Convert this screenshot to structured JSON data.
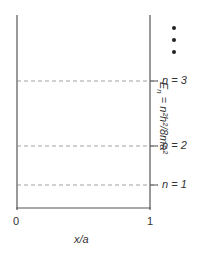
{
  "diagram": {
    "x_axis": {
      "label": "x/a",
      "ticks": [
        "0",
        "1"
      ]
    },
    "levels": [
      {
        "n_label": "n = 3",
        "y": 81
      },
      {
        "n_label": "n = 2",
        "y": 146
      },
      {
        "n_label": "n = 1",
        "y": 185
      }
    ],
    "formula": "En = n²h²/8ma²",
    "formula_parts": {
      "E": "E",
      "n_sub": "n",
      "rest": " = n²h²/8ma²"
    },
    "continuation": "⋮",
    "colors": {
      "line": "#555555",
      "dash": "#888888",
      "text": "#333333"
    }
  }
}
